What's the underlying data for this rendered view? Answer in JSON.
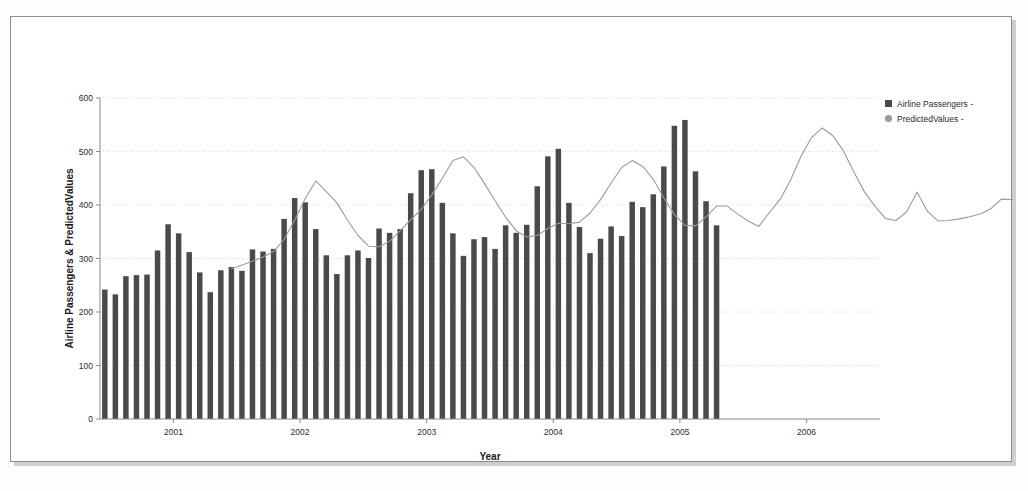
{
  "figure": {
    "background_color": "#ffffff",
    "border_color": "#8d8d8d",
    "bar_color": "#4a4a4a",
    "line_color": "#9a9a9a",
    "grid_color": "#d8d8d8"
  },
  "legend": {
    "position": "right",
    "entries": [
      {
        "label": "Airline Passengers -",
        "marker": "square",
        "color": "#4a4a4a",
        "icon": "legend-square-icon"
      },
      {
        "label": "PredictedValues -",
        "marker": "circle",
        "color": "#9a9a9a",
        "icon": "legend-circle-icon"
      }
    ]
  },
  "chart_data": {
    "type": "bar",
    "title": "",
    "xlabel": "Year",
    "ylabel": "Airline Passengers & PredictedValues",
    "ylim": [
      0,
      600
    ],
    "yticks": [
      0,
      100,
      200,
      300,
      400,
      500,
      600
    ],
    "xlim": [
      2000.42,
      2006.58
    ],
    "xticks": [
      2001,
      2002,
      2003,
      2004,
      2005,
      2006
    ],
    "xtick_labels": [
      "2001",
      "2002",
      "2003",
      "2004",
      "2005",
      "2006"
    ],
    "grid": true,
    "grid_axis": "y",
    "legend_position": "right",
    "x_start": 2000.458,
    "x_step": 0.0833,
    "series": [
      {
        "name": "Airline Passengers -",
        "type": "bar",
        "color": "#4a4a4a",
        "values": [
          242,
          233,
          267,
          269,
          270,
          315,
          364,
          347,
          312,
          274,
          237,
          278,
          284,
          277,
          317,
          313,
          318,
          374,
          413,
          405,
          355,
          306,
          271,
          306,
          315,
          301,
          356,
          348,
          355,
          422,
          465,
          467,
          404,
          347,
          305,
          336,
          340,
          318,
          362,
          348,
          363,
          435,
          491,
          505,
          404,
          359,
          310,
          337,
          360,
          342,
          406,
          396,
          420,
          472,
          548,
          559,
          463,
          407,
          362
        ]
      },
      {
        "name": "PredictedValues -",
        "type": "line",
        "color": "#9a9a9a",
        "x_start": 2001.458,
        "values": [
          281,
          288,
          295,
          303,
          313,
          336,
          372,
          412,
          445,
          425,
          404,
          372,
          343,
          323,
          322,
          332,
          352,
          372,
          392,
          419,
          450,
          483,
          490,
          470,
          440,
          408,
          377,
          352,
          340,
          343,
          356,
          366,
          365,
          368,
          385,
          410,
          441,
          470,
          483,
          472,
          448,
          413,
          382,
          362,
          361,
          378,
          398,
          398,
          383,
          370,
          360,
          386,
          410,
          446,
          491,
          526,
          544,
          530,
          502,
          462,
          425,
          398,
          375,
          371,
          387,
          424,
          388,
          370,
          371,
          374,
          378,
          383,
          393,
          411,
          410,
          412,
          417,
          426,
          429,
          430,
          460,
          510,
          560,
          583,
          571,
          520,
          463,
          412,
          387,
          455
        ]
      }
    ]
  }
}
